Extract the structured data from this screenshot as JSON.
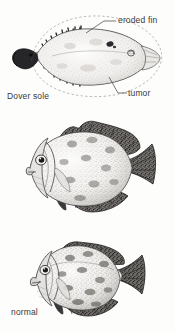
{
  "figure": {
    "background_color": "#fdfdfc",
    "ink_color": "#2b2a2c"
  },
  "panels": [
    {
      "id": "dover-sole",
      "species_label": "Dover sole",
      "view": "dorsal view of flatfish",
      "annotations": [
        {
          "id": "eroded-fin",
          "label": "eroded fin",
          "leader_from": [
            117,
            21
          ],
          "leader_to": [
            86,
            33
          ],
          "describes": "ragged, eaten-away dorsal and anal fin margins compared with the dashed original outline"
        },
        {
          "id": "tumor",
          "label": "tumor",
          "leader_from": [
            127,
            94
          ],
          "leader_to": [
            110,
            76
          ],
          "describes": "dark raised lesion near the caudal peduncle"
        }
      ],
      "dashed_outline_note": "dashed ellipse shows the normal, uneroded body and fin outline"
    },
    {
      "id": "normal-crappie",
      "condition_label": "normal",
      "species_label": "black crappie",
      "view": "lateral view"
    },
    {
      "id": "deformed-crappie",
      "condition_label": "deformed",
      "species_label": "black crappie",
      "view": "lateral view, shortened and humped body"
    }
  ],
  "captions": {
    "dover_sole": "Dover sole",
    "normal": "normal",
    "deformed": "deformed",
    "black_crappie": "black crappie"
  },
  "annotation_labels": {
    "eroded_fin": "eroded fin",
    "tumor": "tumor"
  }
}
